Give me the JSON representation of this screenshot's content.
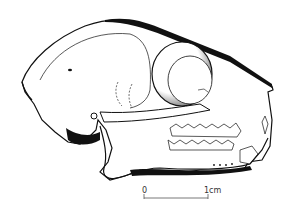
{
  "figure": {
    "colors": {
      "ink": "#111111",
      "paper": "#ffffff",
      "stipple": "#555555"
    }
  },
  "scale_bar": {
    "start_label": "0",
    "end_label": "1cm"
  }
}
